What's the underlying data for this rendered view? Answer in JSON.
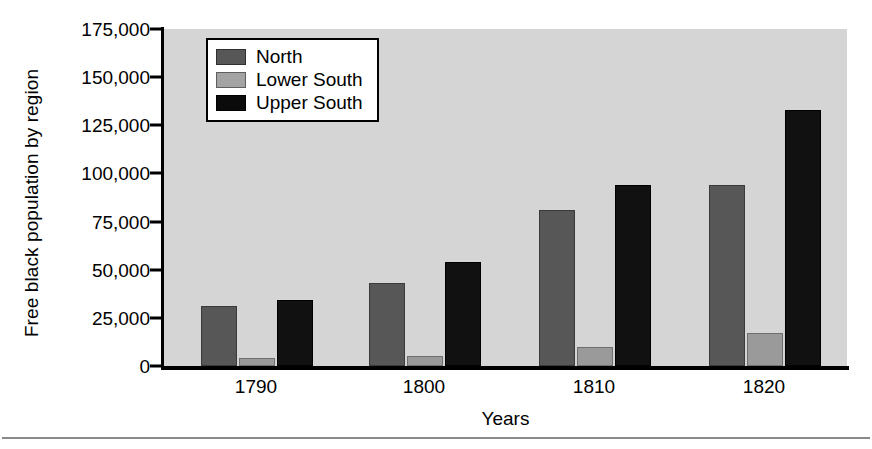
{
  "chart_data": {
    "type": "bar",
    "title": "",
    "xlabel": "Years",
    "ylabel": "Free black population by region",
    "categories": [
      "1790",
      "1800",
      "1810",
      "1820"
    ],
    "series": [
      {
        "name": "North",
        "color": "#575757",
        "values": [
          30000,
          42000,
          80000,
          93000
        ]
      },
      {
        "name": "Lower South",
        "color": "#9a9a9a",
        "values": [
          3000,
          4000,
          9000,
          16000
        ]
      },
      {
        "name": "Upper South",
        "color": "#111111",
        "values": [
          33000,
          53000,
          93000,
          132000
        ]
      }
    ],
    "ylim": [
      0,
      175000
    ],
    "ytick_values": [
      0,
      25000,
      50000,
      75000,
      100000,
      125000,
      150000,
      175000
    ],
    "ytick_labels": [
      "0",
      "25,000",
      "50,000",
      "75,000",
      "100,000",
      "125,000",
      "150,000",
      "175,000"
    ],
    "grid": false,
    "legend_position": "upper left",
    "plot_background": "#d5d5d5",
    "figure_background": "#ffffff"
  },
  "legend": {
    "items": [
      {
        "label": "North",
        "swatch": "north"
      },
      {
        "label": "Lower South",
        "swatch": "lower-south"
      },
      {
        "label": "Upper South",
        "swatch": "upper-south"
      }
    ]
  }
}
